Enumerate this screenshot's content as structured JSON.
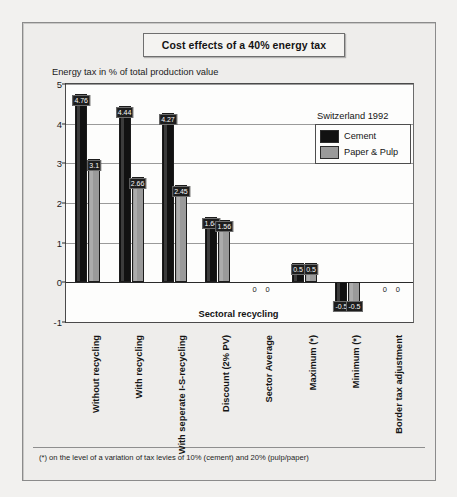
{
  "figure": {
    "title": "Cost effects of a 40% energy tax",
    "footnote": "(*) on the level of a variation of tax levies of 10% (cement) and 20% (pulp/paper)"
  },
  "legend": {
    "title": "Switzerland 1992",
    "entries": [
      {
        "label": "Cement",
        "color": "#111111"
      },
      {
        "label": "Paper & Pulp",
        "color": "#9a9a9a"
      }
    ]
  },
  "chart_data": {
    "type": "bar",
    "title": "Cost effects of a 40% energy tax",
    "subtitle": "Switzerland 1992",
    "xlabel": "Sectoral recycling",
    "ylabel": "Energy tax in % of total production value",
    "ylim": [
      -1,
      5
    ],
    "yticks": [
      "5",
      "4",
      "3",
      "2",
      "1",
      "0",
      "-1"
    ],
    "grid": true,
    "legend_position": "top-right",
    "categories": [
      "Without recycling",
      "With recycling",
      "With seperate I-S-recycling",
      "Discount (2% PV)",
      "Sector Average",
      "Maximum (*)",
      "Minimum (*)",
      "Border tax adjustment"
    ],
    "series": [
      {
        "name": "Cement",
        "color": "#111111",
        "values": [
          4.76,
          4.44,
          4.27,
          1.64,
          0,
          0.5,
          -0.5,
          0
        ],
        "labels": [
          "4.76",
          "4.44",
          "4.27",
          "1.64",
          "0",
          "0.5",
          "-0.5",
          "0"
        ]
      },
      {
        "name": "Paper & Pulp",
        "color": "#9a9a9a",
        "values": [
          3.1,
          2.66,
          2.45,
          1.56,
          0,
          0.5,
          -0.5,
          0
        ],
        "labels": [
          "3.1",
          "2.66",
          "2.45",
          "1.56",
          "0",
          "0.5",
          "-0.5",
          "0"
        ]
      }
    ],
    "annotations": [
      "(*) on the level of a variation of tax levies of 10% (cement) and 20% (pulp/paper)"
    ]
  }
}
